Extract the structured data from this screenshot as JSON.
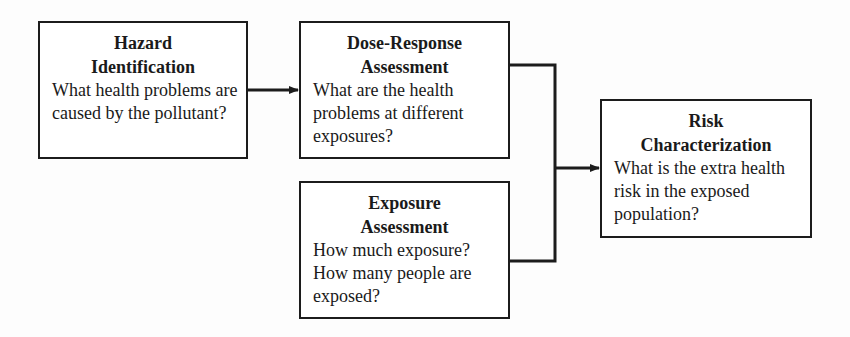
{
  "diagram": {
    "type": "flowchart",
    "boxes": [
      {
        "id": "hazard",
        "title_lines": [
          "Hazard",
          "Identification"
        ],
        "body": "What health problems are caused by the pollutant?"
      },
      {
        "id": "dose_response",
        "title_lines": [
          "Dose-Response",
          "Assessment"
        ],
        "body": "What are the health problems at different exposures?"
      },
      {
        "id": "exposure",
        "title_lines": [
          "Exposure",
          "Assessment"
        ],
        "body": "How much exposure? How many people are exposed?"
      },
      {
        "id": "risk",
        "title_lines": [
          "Risk",
          "Characterization"
        ],
        "body": "What is the extra health risk in the exposed population?"
      }
    ],
    "connections": [
      {
        "from": "hazard",
        "to": "dose_response",
        "style": "arrow"
      },
      {
        "from": "dose_response",
        "to": "risk",
        "style": "elbow-merge-arrow"
      },
      {
        "from": "exposure",
        "to": "risk",
        "style": "elbow-merge-arrow"
      }
    ],
    "colors": {
      "line": "#1c1c1c",
      "background": "#fdfdfd",
      "box_fill": "#ffffff",
      "text": "#1a1a1a"
    }
  }
}
